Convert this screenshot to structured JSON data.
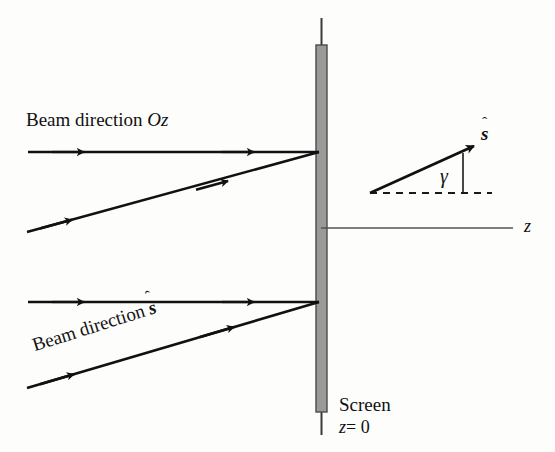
{
  "figure": {
    "type": "optics-ray-diagram",
    "background_color": "#fdfdfc",
    "width": 555,
    "height": 452
  },
  "labels": {
    "beam_direction_oz": {
      "prefix": "Beam direction ",
      "symbol": "Oz"
    },
    "beam_direction_s": {
      "prefix": "Beam direction ",
      "symbol": "s",
      "accent": "ˆ"
    },
    "s_hat_vector": {
      "symbol": "s",
      "accent": "ˆ"
    },
    "angle": {
      "symbol": "γ"
    },
    "z_axis": {
      "symbol": "z"
    },
    "screen": {
      "title": "Screen",
      "position": "z = 0",
      "position_symbol": "z",
      "position_value": "= 0"
    }
  },
  "colors": {
    "ray_stroke": "#111111",
    "screen_fill": "#9a9a9a",
    "screen_edge": "#4a4a4a",
    "axis_stroke": "#555555",
    "dashed_stroke": "#1a1a1a",
    "text": "#111111"
  },
  "geometry": {
    "screen": {
      "x": 316,
      "y": 45,
      "width": 11,
      "height": 367,
      "stem_top_y": 18,
      "stem_bottom_y": 435
    },
    "z_axis": {
      "x1": 321,
      "y1": 228,
      "x2": 513,
      "y2": 228
    },
    "upper_ray_horizontal": {
      "x1": 28,
      "y1": 152,
      "x2": 318,
      "y2": 152,
      "arrow_count": 2
    },
    "upper_ray_slanted": {
      "x1": 27,
      "y1": 232,
      "x2": 318,
      "y2": 152,
      "arrow_count": 2
    },
    "lower_ray_horizontal": {
      "x1": 28,
      "y1": 302,
      "x2": 318,
      "y2": 302,
      "arrow_count": 2
    },
    "lower_ray_slanted": {
      "x1": 27,
      "y1": 388,
      "x2": 318,
      "y2": 302,
      "arrow_count": 2
    },
    "s_hat_arrow": {
      "x1": 370,
      "y1": 193,
      "x2": 474,
      "y2": 146
    },
    "dashed_reference": {
      "x1": 370,
      "y1": 193,
      "x2": 492,
      "y2": 193
    },
    "angle_tick": {
      "x1": 463,
      "y1": 152,
      "x2": 463,
      "y2": 193
    }
  }
}
